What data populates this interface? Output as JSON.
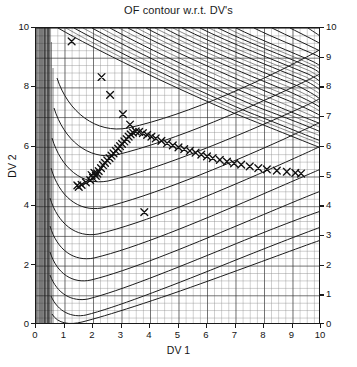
{
  "figure": {
    "title": "OF contour w.r.t. DV's",
    "xlabel": "DV 1",
    "ylabel": "DV 2"
  },
  "axes": {
    "left_ticks": [
      "10",
      "8",
      "6",
      "4",
      "2",
      "0"
    ],
    "right_ticks": [
      "10",
      "9",
      "8",
      "7",
      "6",
      "5",
      "4",
      "3",
      "2",
      "1",
      "0"
    ],
    "bottom_ticks": [
      "0",
      "1",
      "2",
      "3",
      "4",
      "5",
      "6",
      "7",
      "8",
      "9",
      "10"
    ],
    "left_corner_label": "0",
    "right_corner_label": "10"
  },
  "chart_data": {
    "type": "line",
    "title": "OF contour w.r.t. DV's",
    "xlabel": "DV 1",
    "ylabel": "DV 2",
    "xlim": [
      0,
      10
    ],
    "ylim": [
      0,
      10
    ],
    "grid": true,
    "grid_minor_step": 0.25,
    "legend": null,
    "series": [
      {
        "name": "optimizer path",
        "marker": "x",
        "style": "markers",
        "color": "#111111",
        "x": [
          1.25,
          3.8,
          1.45,
          1.5,
          1.6,
          1.75,
          1.9,
          2.0,
          2.1,
          2.15,
          2.2,
          2.28,
          2.35,
          2.42,
          2.5,
          2.58,
          2.65,
          2.72,
          2.8,
          2.88,
          2.95,
          3.02,
          3.1,
          3.18,
          3.25,
          3.32,
          3.4,
          3.5,
          3.62,
          3.75,
          3.9,
          4.05,
          4.2,
          4.4,
          4.6,
          4.8,
          5.0,
          5.2,
          5.4,
          5.6,
          5.8,
          6.0,
          6.2,
          6.45,
          6.7,
          6.95,
          7.2,
          7.5,
          7.8,
          8.1,
          8.45,
          8.8,
          9.1,
          9.3,
          2.3,
          2.6,
          3.05,
          3.3,
          1.95,
          2.05
        ],
        "y": [
          9.55,
          3.8,
          4.7,
          4.65,
          4.72,
          4.8,
          4.88,
          4.95,
          5.02,
          5.1,
          5.18,
          5.28,
          5.38,
          5.46,
          5.54,
          5.62,
          5.7,
          5.78,
          5.86,
          5.94,
          6.02,
          6.1,
          6.18,
          6.26,
          6.34,
          6.42,
          6.48,
          6.52,
          6.5,
          6.46,
          6.4,
          6.34,
          6.28,
          6.2,
          6.12,
          6.05,
          5.98,
          5.92,
          5.86,
          5.8,
          5.74,
          5.68,
          5.62,
          5.56,
          5.5,
          5.44,
          5.4,
          5.34,
          5.28,
          5.24,
          5.2,
          5.16,
          5.12,
          5.1,
          8.35,
          7.75,
          7.1,
          6.75,
          5.05,
          5.12
        ]
      }
    ],
    "contours": {
      "description": "objective-function contour levels of a banana-like valley, dense near DV1=0 and sweeping diagonally across the upper-right region",
      "n_levels": 26,
      "orientation": "descending diagonals upper-right, rising curved valleys lower-left"
    }
  }
}
